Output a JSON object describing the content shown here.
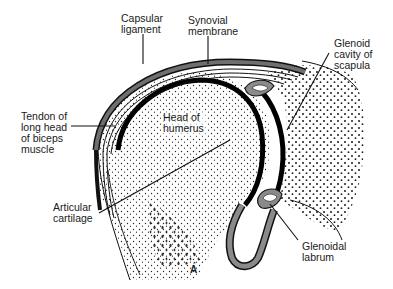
{
  "figure": {
    "panel_letter": "A",
    "colors": {
      "ink": "#111111",
      "membrane_gray": "#8a8a8a",
      "capsule_gray": "#6f6f6f",
      "background": "#ffffff"
    }
  },
  "labels": {
    "capsular_ligament": {
      "line1": "Capsular",
      "line2": "ligament"
    },
    "synovial_membrane": {
      "line1": "Synovial",
      "line2": "membrane"
    },
    "glenoid_cavity": {
      "line1": "Glenoid",
      "line2": "cavity of",
      "line3": "scapula"
    },
    "tendon_biceps": {
      "line1": "Tendon of",
      "line2": "long head",
      "line3": "of biceps",
      "line4": "muscle"
    },
    "head_of_humerus": {
      "line1": "Head of",
      "line2": "humerus"
    },
    "articular_cartilage": {
      "line1": "Articular",
      "line2": "cartilage"
    },
    "glenoidal_labrum": {
      "line1": "Glenoidal",
      "line2": "labrum"
    }
  }
}
